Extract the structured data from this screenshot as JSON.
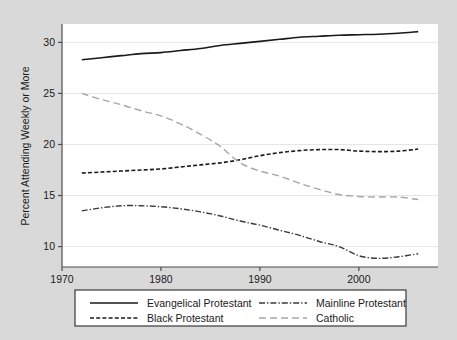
{
  "chart_data": {
    "type": "line",
    "title": "",
    "xlabel": "",
    "ylabel": "Percent Attending Weekly or More",
    "xlim": [
      1970.0,
      2008.0
    ],
    "ylim": [
      8.0,
      31.8
    ],
    "xticks": [
      1970,
      1980,
      1990,
      2000
    ],
    "xticklabels": [
      "1970",
      "1980",
      "1990",
      "2000"
    ],
    "yticks": [
      10,
      15,
      20,
      25,
      30
    ],
    "yticklabels": [
      "10",
      "15",
      "20",
      "25",
      "30"
    ],
    "grid": "horizontal",
    "legend_position": "below-axes",
    "x": [
      1972,
      1974,
      1976,
      1978,
      1980,
      1982,
      1984,
      1986,
      1988,
      1990,
      1992,
      1994,
      1996,
      1998,
      2000,
      2002,
      2004,
      2006
    ],
    "series": [
      {
        "name": "Evangelical Protestant",
        "style": "solid",
        "color": "#1a1a1a",
        "width": 1.6,
        "values": [
          28.3,
          28.5,
          28.7,
          28.9,
          29.0,
          29.2,
          29.4,
          29.7,
          29.9,
          30.1,
          30.3,
          30.5,
          30.6,
          30.7,
          30.75,
          30.8,
          30.9,
          31.05
        ]
      },
      {
        "name": "Black Protestant",
        "style": "dashed",
        "color": "#1a1a1a",
        "width": 1.6,
        "values": [
          17.2,
          17.3,
          17.4,
          17.5,
          17.6,
          17.8,
          18.0,
          18.2,
          18.5,
          18.9,
          19.2,
          19.4,
          19.5,
          19.5,
          19.35,
          19.3,
          19.35,
          19.55
        ]
      },
      {
        "name": "Mainline Protestant",
        "style": "dashdot",
        "color": "#3a3a3a",
        "width": 1.4,
        "values": [
          13.5,
          13.8,
          14.0,
          14.0,
          13.9,
          13.7,
          13.4,
          13.0,
          12.5,
          12.1,
          11.6,
          11.1,
          10.5,
          10.0,
          9.1,
          8.85,
          9.0,
          9.3
        ]
      },
      {
        "name": "Catholic",
        "style": "longdash",
        "color": "#a6a6a6",
        "width": 1.4,
        "values": [
          25.0,
          24.4,
          23.9,
          23.3,
          22.8,
          22.0,
          21.0,
          19.8,
          18.2,
          17.4,
          16.9,
          16.2,
          15.6,
          15.1,
          14.9,
          14.85,
          14.85,
          14.6
        ]
      }
    ]
  },
  "axis": {
    "ylabel": "Percent Attending Weekly or More",
    "ytick_labels": [
      "30",
      "25",
      "20",
      "15",
      "10"
    ],
    "xtick_labels": [
      "1970",
      "1980",
      "1990",
      "2000"
    ]
  },
  "legend": {
    "entries": [
      {
        "label": "Evangelical Protestant",
        "style": "solid"
      },
      {
        "label": "Mainline Protestant",
        "style": "dashdot"
      },
      {
        "label": "Black Protestant",
        "style": "dashed"
      },
      {
        "label": "Catholic",
        "style": "longdash"
      }
    ]
  },
  "colors": {
    "background": "#d9d9d9",
    "plot_background": "#ffffff",
    "gridline": "#e6e6e6",
    "axis": "#4d4d4d",
    "evangelical": "#1a1a1a",
    "black_protestant": "#1a1a1a",
    "mainline": "#3a3a3a",
    "catholic": "#a6a6a6"
  }
}
